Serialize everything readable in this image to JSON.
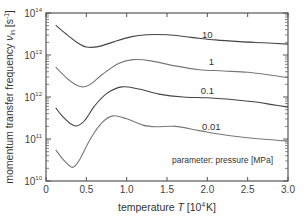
{
  "chart_data": {
    "type": "line",
    "title": "",
    "xlabel": "temperature T [10^4 K]",
    "ylabel": "momentum transfer frequency ν_in [s^-1]",
    "xlim": [
      0,
      3.0
    ],
    "ylim": [
      10000000000.0,
      100000000000000.0
    ],
    "yscale": "log",
    "xticks": [
      0,
      0.5,
      1.0,
      1.5,
      2.0,
      2.5,
      3.0
    ],
    "xtick_labels": [
      "0",
      "0.5",
      "1.0",
      "1.5",
      "2.0",
      "2.5",
      "3.0"
    ],
    "yticks_exp": [
      10,
      11,
      12,
      13,
      14
    ],
    "grid": false,
    "annotation": "parameter: pressure [MPa]",
    "series": [
      {
        "name": "10",
        "x": [
          0.12,
          0.25,
          0.4,
          0.5,
          0.65,
          0.85,
          1.05,
          1.25,
          1.5,
          1.8,
          2.1,
          2.4,
          2.7,
          3.0
        ],
        "log10y": [
          13.71,
          13.5,
          13.28,
          13.19,
          13.2,
          13.32,
          13.43,
          13.48,
          13.48,
          13.42,
          13.36,
          13.32,
          13.29,
          13.26
        ],
        "label_x": 2.0,
        "label_log10y": 13.41
      },
      {
        "name": "1",
        "x": [
          0.12,
          0.22,
          0.33,
          0.45,
          0.55,
          0.7,
          0.9,
          1.08,
          1.3,
          1.6,
          1.9,
          2.2,
          2.5,
          2.75,
          3.0
        ],
        "log10y": [
          12.71,
          12.52,
          12.34,
          12.24,
          12.3,
          12.54,
          12.8,
          12.89,
          12.86,
          12.74,
          12.65,
          12.62,
          12.59,
          12.53,
          12.46
        ],
        "label_x": 2.05,
        "label_log10y": 12.76
      },
      {
        "name": "0.1",
        "x": [
          0.12,
          0.2,
          0.3,
          0.38,
          0.48,
          0.6,
          0.75,
          0.94,
          1.15,
          1.4,
          1.7,
          2.0,
          2.3,
          2.6,
          2.8,
          3.0
        ],
        "log10y": [
          11.74,
          11.55,
          11.37,
          11.31,
          11.44,
          11.78,
          12.08,
          12.24,
          12.19,
          12.07,
          12.0,
          11.98,
          11.94,
          11.88,
          11.82,
          11.76
        ],
        "label_x": 2.0,
        "label_log10y": 12.06
      },
      {
        "name": "0.01",
        "x": [
          0.12,
          0.2,
          0.28,
          0.34,
          0.42,
          0.55,
          0.7,
          0.83,
          1.0,
          1.2,
          1.37,
          1.6,
          1.9,
          2.2,
          2.5,
          2.8,
          3.0
        ],
        "log10y": [
          10.74,
          10.54,
          10.38,
          10.33,
          10.52,
          11.0,
          11.4,
          11.55,
          11.48,
          11.33,
          11.29,
          11.3,
          11.2,
          11.1,
          11.03,
          10.98,
          10.95
        ],
        "label_x": 2.05,
        "label_log10y": 11.21
      }
    ]
  },
  "axes": {
    "y_title_main": "momentum transfer frequency ",
    "y_title_symbol": "ν",
    "y_title_sub": "in",
    "y_title_unit": " [s",
    "y_title_unit_sup": "-1",
    "y_title_close": "]",
    "x_title_main": "temperature ",
    "x_title_symbol": "T",
    "x_title_unit": "  [10",
    "x_title_unit_sup": "4",
    "x_title_close": "K]",
    "y_tick_base": "10"
  }
}
